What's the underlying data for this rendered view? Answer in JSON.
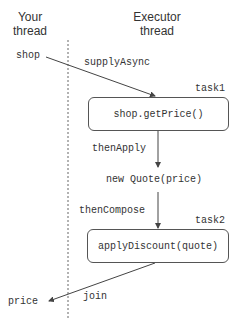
{
  "columns": {
    "your_thread": "Your\nthread",
    "your_thread_line1": "Your",
    "your_thread_line2": "thread",
    "executor_thread_line1": "Executor",
    "executor_thread_line2": "thread"
  },
  "labels": {
    "shop": "shop",
    "supply_async": "supplyAsync",
    "task1": "task1",
    "then_apply": "thenApply",
    "new_quote": "new Quote(price)",
    "then_compose": "thenCompose",
    "task2": "task2",
    "price": "price",
    "join": "join"
  },
  "boxes": {
    "task1_box": "shop.getPrice()",
    "task2_box": "applyDiscount(quote)"
  },
  "colors": {
    "line": "#444444",
    "text": "#333333"
  }
}
